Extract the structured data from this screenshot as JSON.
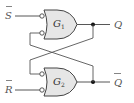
{
  "diagram": {
    "type": "SR latch (NAND, active-low inputs)",
    "inputs": [
      {
        "label": "S",
        "overbar": true
      },
      {
        "label": "R",
        "overbar": true
      }
    ],
    "outputs": [
      {
        "label": "Q",
        "overbar": false
      },
      {
        "label": "Q",
        "overbar": true
      }
    ],
    "gates": [
      {
        "name": "G",
        "sub": "1"
      },
      {
        "name": "G",
        "sub": "2"
      }
    ],
    "colors": {
      "gate_fill": "#e6e6e6",
      "stroke": "#444444",
      "label": "#555555"
    }
  }
}
